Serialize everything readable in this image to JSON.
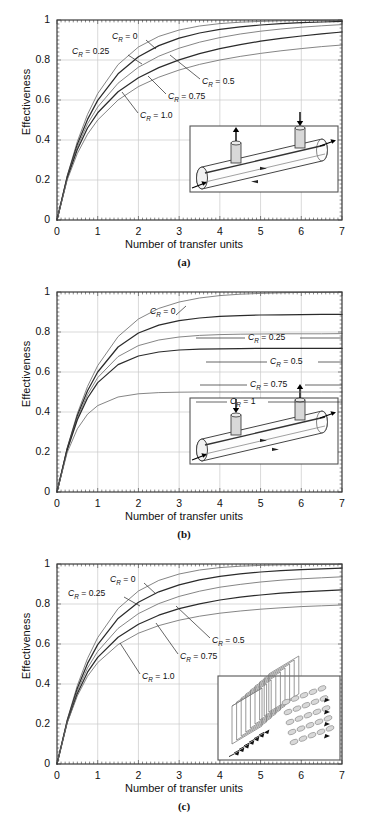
{
  "figure": {
    "axis": {
      "xlabel": "Number of transfer units",
      "ylabel": "Effectiveness",
      "xticks": [
        "0",
        "1",
        "2",
        "3",
        "4",
        "5",
        "6",
        "7"
      ],
      "yticks": [
        "0",
        "0.2",
        "0.4",
        "0.6",
        "0.8",
        "1"
      ],
      "xlim": [
        0,
        7
      ],
      "ylim": [
        0,
        1
      ],
      "grid": true
    },
    "colors": {
      "axis": "#3a3a3a",
      "grid": "#c9c9c9",
      "curve_dark": "#2b2b2b",
      "curve_light": "#6f6f6f",
      "inset_border": "#555555",
      "inset_fill": "#ffffff",
      "shape_fill": "#d8d8d8"
    },
    "panels": [
      {
        "id": "a",
        "caption": "(a)",
        "inset_name": "counter-flow-double-pipe-diagram",
        "chart_data": {
          "type": "line",
          "title": "",
          "xlabel": "Number of transfer units",
          "ylabel": "Effectiveness",
          "xlim": [
            0,
            7
          ],
          "ylim": [
            0,
            1
          ],
          "grid": true,
          "arrangement": "counter-flow",
          "x": [
            0,
            0.25,
            0.5,
            0.75,
            1,
            1.5,
            2,
            2.5,
            3,
            3.5,
            4,
            4.5,
            5,
            5.5,
            6,
            6.5,
            7
          ],
          "series": [
            {
              "name": "C_R = 0",
              "label": "C",
              "sub": "R",
              "value": "0",
              "values": [
                0,
                0.221,
                0.393,
                0.528,
                0.632,
                0.777,
                0.865,
                0.918,
                0.95,
                0.97,
                0.982,
                0.989,
                0.993,
                0.996,
                0.998,
                0.998,
                0.999
              ]
            },
            {
              "name": "C_R = 0.25",
              "label": "C",
              "sub": "R",
              "value": "0.25",
              "values": [
                0,
                0.216,
                0.379,
                0.503,
                0.598,
                0.731,
                0.816,
                0.872,
                0.909,
                0.935,
                0.953,
                0.966,
                0.975,
                0.982,
                0.987,
                0.99,
                0.993
              ]
            },
            {
              "name": "C_R = 0.5",
              "label": "C",
              "sub": "R",
              "value": "0.5",
              "values": [
                0,
                0.212,
                0.366,
                0.481,
                0.565,
                0.684,
                0.764,
                0.819,
                0.859,
                0.889,
                0.912,
                0.93,
                0.944,
                0.955,
                0.964,
                0.971,
                0.977
              ]
            },
            {
              "name": "C_R = 0.75",
              "label": "C",
              "sub": "R",
              "value": "0.75",
              "values": [
                0,
                0.208,
                0.353,
                0.46,
                0.536,
                0.641,
                0.711,
                0.762,
                0.801,
                0.832,
                0.857,
                0.877,
                0.894,
                0.908,
                0.92,
                0.931,
                0.94
              ]
            },
            {
              "name": "C_R = 1.0",
              "label": "C",
              "sub": "R",
              "value": "1.0",
              "values": [
                0,
                0.2,
                0.333,
                0.429,
                0.5,
                0.6,
                0.667,
                0.714,
                0.75,
                0.778,
                0.8,
                0.818,
                0.833,
                0.846,
                0.857,
                0.867,
                0.875
              ]
            }
          ]
        }
      },
      {
        "id": "b",
        "caption": "(b)",
        "inset_name": "parallel-flow-double-pipe-diagram",
        "chart_data": {
          "type": "line",
          "title": "",
          "xlabel": "Number of transfer units",
          "ylabel": "Effectiveness",
          "xlim": [
            0,
            7
          ],
          "ylim": [
            0,
            1
          ],
          "grid": true,
          "arrangement": "parallel-flow",
          "x": [
            0,
            0.25,
            0.5,
            0.75,
            1,
            1.5,
            2,
            2.5,
            3,
            3.5,
            4,
            4.5,
            5,
            5.5,
            6,
            6.5,
            7
          ],
          "series": [
            {
              "name": "C_R = 0",
              "label": "C",
              "sub": "R",
              "value": "0",
              "values": [
                0,
                0.221,
                0.393,
                0.528,
                0.632,
                0.777,
                0.865,
                0.918,
                0.95,
                0.97,
                0.982,
                0.989,
                0.993,
                0.996,
                0.998,
                0.998,
                0.999
              ]
            },
            {
              "name": "C_R = 0.25",
              "label": "C",
              "sub": "R",
              "value": "0.25",
              "values": [
                0,
                0.217,
                0.382,
                0.506,
                0.6,
                0.725,
                0.795,
                0.834,
                0.857,
                0.87,
                0.878,
                0.882,
                0.885,
                0.886,
                0.887,
                0.888,
                0.888
              ]
            },
            {
              "name": "C_R = 0.5",
              "label": "C",
              "sub": "R",
              "value": "0.5",
              "values": [
                0,
                0.213,
                0.371,
                0.487,
                0.572,
                0.677,
                0.732,
                0.76,
                0.775,
                0.783,
                0.787,
                0.789,
                0.79,
                0.791,
                0.791,
                0.791,
                0.792
              ]
            },
            {
              "name": "C_R = 0.75",
              "label": "C",
              "sub": "R",
              "value": "0.75",
              "values": [
                0,
                0.21,
                0.361,
                0.47,
                0.547,
                0.637,
                0.68,
                0.7,
                0.71,
                0.714,
                0.716,
                0.717,
                0.718,
                0.718,
                0.718,
                0.718,
                0.718
              ]
            },
            {
              "name": "C_R = 1",
              "label": "C",
              "sub": "R",
              "value": "1",
              "values": [
                0,
                0.197,
                0.316,
                0.389,
                0.432,
                0.475,
                0.491,
                0.497,
                0.499,
                0.5,
                0.5,
                0.5,
                0.5,
                0.5,
                0.5,
                0.5,
                0.5
              ]
            }
          ],
          "asymptotes": {
            "C_R = 0.25": 0.8,
            "C_R = 0.5": 0.667,
            "C_R = 0.75": 0.571,
            "C_R = 1": 0.5
          }
        }
      },
      {
        "id": "c",
        "caption": "(c)",
        "inset_name": "cross-flow-finned-plate-diagram",
        "chart_data": {
          "type": "line",
          "title": "",
          "xlabel": "Number of transfer units",
          "ylabel": "Effectiveness",
          "xlim": [
            0,
            7
          ],
          "ylim": [
            0,
            1
          ],
          "grid": true,
          "arrangement": "cross-flow",
          "x": [
            0,
            0.25,
            0.5,
            0.75,
            1,
            1.5,
            2,
            2.5,
            3,
            3.5,
            4,
            4.5,
            5,
            5.5,
            6,
            6.5,
            7
          ],
          "series": [
            {
              "name": "C_R = 0",
              "label": "C",
              "sub": "R",
              "value": "0",
              "values": [
                0,
                0.221,
                0.393,
                0.528,
                0.632,
                0.777,
                0.865,
                0.918,
                0.95,
                0.97,
                0.982,
                0.989,
                0.993,
                0.996,
                0.998,
                0.998,
                0.999
              ]
            },
            {
              "name": "C_R = 0.25",
              "label": "C",
              "sub": "R",
              "value": "0.25",
              "values": [
                0,
                0.216,
                0.379,
                0.503,
                0.597,
                0.728,
                0.809,
                0.861,
                0.896,
                0.921,
                0.938,
                0.951,
                0.96,
                0.967,
                0.972,
                0.976,
                0.979
              ]
            },
            {
              "name": "C_R = 0.5",
              "label": "C",
              "sub": "R",
              "value": "0.5",
              "values": [
                0,
                0.212,
                0.366,
                0.48,
                0.563,
                0.678,
                0.752,
                0.802,
                0.838,
                0.864,
                0.884,
                0.898,
                0.91,
                0.919,
                0.926,
                0.931,
                0.936
              ]
            },
            {
              "name": "C_R = 0.75",
              "label": "C",
              "sub": "R",
              "value": "0.75",
              "values": [
                0,
                0.208,
                0.353,
                0.459,
                0.533,
                0.634,
                0.699,
                0.744,
                0.777,
                0.801,
                0.82,
                0.834,
                0.845,
                0.854,
                0.861,
                0.866,
                0.871
              ]
            },
            {
              "name": "C_R = 1.0",
              "label": "C",
              "sub": "R",
              "value": "1.0",
              "values": [
                0,
                0.205,
                0.341,
                0.439,
                0.507,
                0.597,
                0.654,
                0.692,
                0.719,
                0.739,
                0.754,
                0.765,
                0.774,
                0.781,
                0.787,
                0.791,
                0.795
              ]
            }
          ]
        }
      }
    ]
  }
}
